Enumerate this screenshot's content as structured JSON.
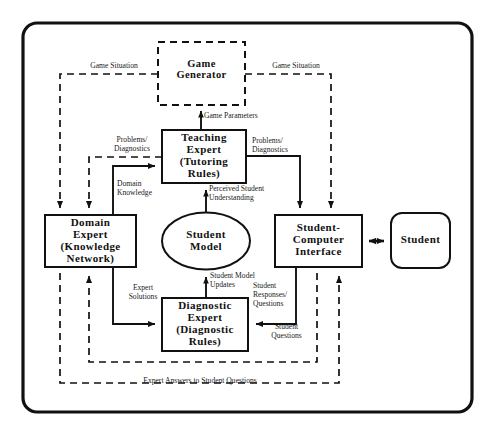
{
  "diagram": {
    "frame": {
      "name": "system-boundary"
    },
    "nodes": [
      {
        "id": "game-generator",
        "label": "Game\nGenerator",
        "style": "dashed-box"
      },
      {
        "id": "teaching-expert",
        "label": "Teaching\nExpert\n(Tutoring\nRules)",
        "style": "solid-box"
      },
      {
        "id": "domain-expert",
        "label": "Domain\nExpert\n(Knowledge\nNetwork)",
        "style": "solid-box"
      },
      {
        "id": "student-model",
        "label": "Student\nModel",
        "style": "ellipse"
      },
      {
        "id": "sci",
        "label": "Student-\nComputer\nInterface",
        "style": "solid-box"
      },
      {
        "id": "student",
        "label": "Student",
        "style": "rounded-box"
      },
      {
        "id": "diagnostic-expert",
        "label": "Diagnostic\nExpert\n(Diagnostic\nRules)",
        "style": "solid-box"
      }
    ],
    "edge_labels": [
      {
        "id": "game-situation-left",
        "text": "Game Situation"
      },
      {
        "id": "game-situation-right",
        "text": "Game Situation"
      },
      {
        "id": "game-parameters",
        "text": "Game Parameters"
      },
      {
        "id": "problems-diagnostics-left",
        "text": "Problems/\nDiagnostics"
      },
      {
        "id": "problems-diagnostics-right",
        "text": "Problems/\nDiagnostics"
      },
      {
        "id": "domain-knowledge",
        "text": "Domain\nKnowledge"
      },
      {
        "id": "perceived-student-understanding",
        "text": "Perceived Student\nUnderstanding"
      },
      {
        "id": "student-model-updates",
        "text": "Student Model\nUpdates"
      },
      {
        "id": "expert-solutions",
        "text": "Expert\nSolutions"
      },
      {
        "id": "student-responses-questions",
        "text": "Student\nResponses/\nQuestions"
      },
      {
        "id": "student-questions",
        "text": "Student\nQuestions"
      },
      {
        "id": "expert-answers",
        "text": "Expert Answers to Student Questions"
      }
    ],
    "colors": {
      "stroke": "#111111",
      "background": "#ffffff",
      "text": "#111111"
    }
  }
}
